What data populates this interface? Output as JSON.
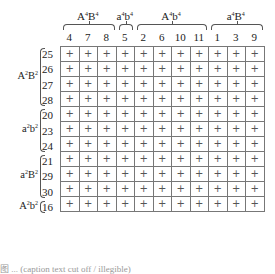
{
  "column_groups": [
    {
      "label_base": "A",
      "label_sup1": "4",
      "label_mid": "B",
      "label_sup2": "4",
      "columns": [
        "4",
        "7",
        "8"
      ]
    },
    {
      "label_base": "a",
      "label_sup1": "4",
      "label_mid": "b",
      "label_sup2": "4",
      "columns": [
        "5"
      ]
    },
    {
      "label_base": "A",
      "label_sup1": "4",
      "label_mid": "b",
      "label_sup2": "4",
      "columns": [
        "2",
        "6",
        "10",
        "11"
      ]
    },
    {
      "label_base": "a",
      "label_sup1": "4",
      "label_mid": "B",
      "label_sup2": "4",
      "columns": [
        "1",
        "3",
        "9"
      ]
    }
  ],
  "columns": [
    "4",
    "7",
    "8",
    "5",
    "2",
    "6",
    "10",
    "11",
    "1",
    "3",
    "9"
  ],
  "row_groups": [
    {
      "label_base": "A",
      "label_sup1": "2",
      "label_mid": "B",
      "label_sup2": "2",
      "rows": [
        "25",
        "26",
        "27",
        "28"
      ]
    },
    {
      "label_base": "a",
      "label_sup1": "2",
      "label_mid": "b",
      "label_sup2": "2",
      "rows": [
        "20",
        "23",
        "24"
      ]
    },
    {
      "label_base": "a",
      "label_sup1": "2",
      "label_mid": "B",
      "label_sup2": "2",
      "rows": [
        "21",
        "29",
        "30"
      ]
    },
    {
      "label_base": "A",
      "label_sup1": "2",
      "label_mid": "b",
      "label_sup2": "2",
      "rows": [
        "16"
      ]
    }
  ],
  "rows": [
    "25",
    "26",
    "27",
    "28",
    "20",
    "23",
    "24",
    "21",
    "29",
    "30",
    "16"
  ],
  "cell_symbol": "+",
  "caption": "图 ... (caption text cut off / illegible)"
}
